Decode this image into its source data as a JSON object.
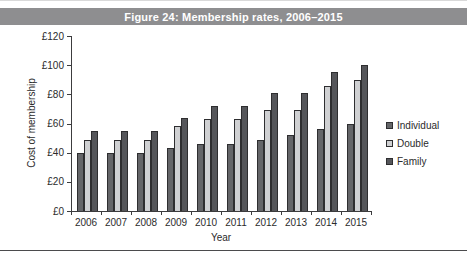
{
  "title_bar": {
    "text": "Figure 24: Membership rates, 2006–2015",
    "bg": "#8e8e90",
    "fg": "#ffffff"
  },
  "chart_data": {
    "type": "bar",
    "title": "Figure 24: Membership rates, 2006–2015",
    "categories": [
      "2006",
      "2007",
      "2008",
      "2009",
      "2010",
      "2011",
      "2012",
      "2013",
      "2014",
      "2015"
    ],
    "series": [
      {
        "name": "Individual",
        "color": "#646568",
        "values": [
          40,
          40,
          40,
          43,
          46,
          46,
          49,
          52,
          56,
          60
        ]
      },
      {
        "name": "Double",
        "color": "#cfd0d2",
        "values": [
          49,
          49,
          49,
          58,
          63,
          63,
          69,
          69,
          86,
          90
        ]
      },
      {
        "name": "Family",
        "color": "#55565a",
        "values": [
          55,
          55,
          55,
          64,
          72,
          72,
          81,
          81,
          95,
          100
        ]
      }
    ],
    "xlabel": "Year",
    "ylabel": "Cost of membership",
    "ylim": [
      0,
      120
    ],
    "ytick_step": 20,
    "ytick_prefix": "£",
    "ytick_labels": [
      "£0",
      "£20",
      "£40",
      "£60",
      "£80",
      "£100",
      "£120"
    ],
    "grid": false,
    "legend_position": "right",
    "bar_border_color": "#2e2e30"
  }
}
